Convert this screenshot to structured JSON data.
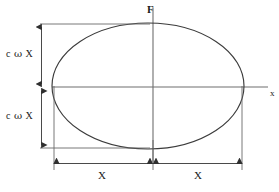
{
  "diagram": {
    "axes": {
      "vertical_label": "F",
      "horizontal_label": "x"
    },
    "dimension_labels": {
      "vertical_upper": {
        "coefficient": "c",
        "symbol": "ω",
        "variable": "X"
      },
      "vertical_lower": {
        "coefficient": "c",
        "symbol": "ω",
        "variable": "X"
      },
      "horizontal_left": "X",
      "horizontal_right": "X"
    },
    "colors": {
      "curve": "#3a3a3a",
      "axis": "#6a6a6a",
      "dimension": "#4a4a4a",
      "text": "#1a1a1a",
      "background": "#ffffff"
    },
    "geometry": {
      "ellipse_center_x": 148,
      "ellipse_center_y": 86,
      "ellipse_radius_x": 96,
      "ellipse_radius_y": 63,
      "axis_origin_x": 153,
      "axis_origin_y": 87
    }
  }
}
